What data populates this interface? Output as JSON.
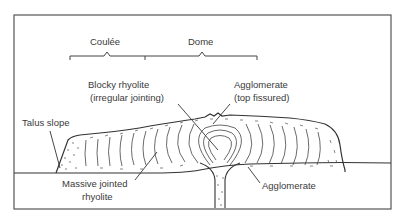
{
  "diagram": {
    "type": "cross-section",
    "colors": {
      "line": "#3a3a3a",
      "background": "#ffffff"
    }
  },
  "brackets": {
    "coulee": "Coulée",
    "dome": "Dome"
  },
  "labels": {
    "blocky_line1": "Blocky rhyolite",
    "blocky_line2": "(irregular jointing)",
    "agg_top_line1": "Agglomerate",
    "agg_top_line2": "(top fissured)",
    "talus": "Talus slope",
    "massive_line1": "Massive jointed",
    "massive_line2": "rhyolite",
    "agg_bottom": "Agglomerate"
  }
}
